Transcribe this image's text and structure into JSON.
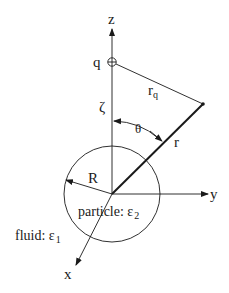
{
  "diagram": {
    "colors": {
      "stroke": "#1a1a1a",
      "background": "#ffffff"
    },
    "axes": {
      "z": {
        "label": "z"
      },
      "y": {
        "label": "y"
      },
      "x": {
        "label": "x"
      }
    },
    "charge": {
      "label": "q",
      "symbol": "circle-plus"
    },
    "distances": {
      "zeta": "ζ",
      "r_q_main": "r",
      "r_q_sub": "q",
      "r": "r",
      "theta": "θ",
      "radius": "R"
    },
    "regions": {
      "particle_label": "particle: ε",
      "particle_sub": "2",
      "fluid_label": "fluid: ε",
      "fluid_sub": "1"
    }
  }
}
